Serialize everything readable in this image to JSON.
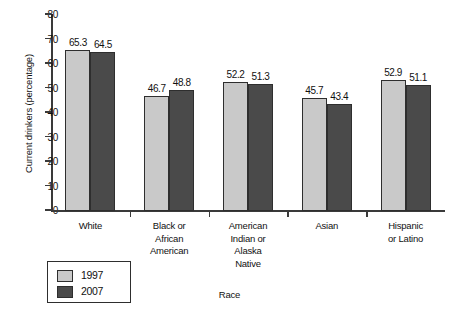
{
  "chart_data": {
    "type": "bar",
    "title": "",
    "xlabel": "Race",
    "ylabel": "Current drinkers (percentage)",
    "ylim": [
      0,
      80
    ],
    "yticks": [
      0,
      10,
      20,
      30,
      40,
      50,
      60,
      70,
      80
    ],
    "grid": false,
    "legend_position": "bottom-left",
    "categories": [
      "White",
      "Black or African American",
      "American Indian or Alaska Native",
      "Asian",
      "Hispanic or Latino"
    ],
    "category_lines": [
      [
        "White"
      ],
      [
        "Black or",
        "African",
        "American"
      ],
      [
        "American",
        "Indian or",
        "Alaska",
        "Native"
      ],
      [
        "Asian"
      ],
      [
        "Hispanic",
        "or Latino"
      ]
    ],
    "series": [
      {
        "name": "1997",
        "color": "#c9c9c9",
        "values": [
          65.3,
          46.7,
          52.2,
          45.7,
          52.9
        ]
      },
      {
        "name": "2007",
        "color": "#4a4a4a",
        "values": [
          64.5,
          48.8,
          51.3,
          43.4,
          51.1
        ]
      }
    ]
  },
  "legend": {
    "items": [
      {
        "label": "1997",
        "color": "#c9c9c9"
      },
      {
        "label": "2007",
        "color": "#4a4a4a"
      }
    ]
  },
  "colors": {
    "series_1997": "#c9c9c9",
    "series_2007": "#4a4a4a",
    "axis": "#3a3a3a",
    "text": "#111111",
    "background": "#ffffff"
  }
}
